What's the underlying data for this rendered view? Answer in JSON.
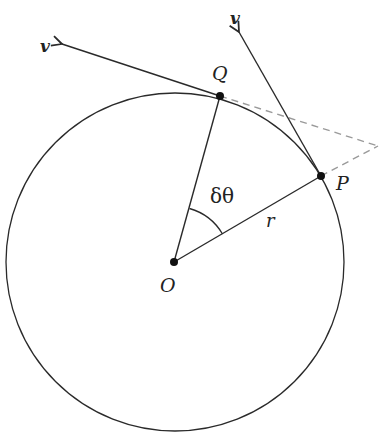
{
  "diagram": {
    "title": "",
    "labels": {
      "center": "O",
      "point_p": "P",
      "point_q": "Q",
      "radius": "r",
      "angle": "δθ",
      "velocity_p": "v",
      "velocity_q": "v"
    },
    "colors": {
      "stroke": "#2a2a2a",
      "dashed": "#9a9a9a",
      "background": "#ffffff"
    },
    "geometry": {
      "center": [
        174,
        262
      ],
      "radius": 169,
      "P": [
        321,
        176
      ],
      "Q": [
        220,
        96
      ],
      "v_at_P_tip": [
        238,
        30
      ],
      "v_at_Q_tip": [
        60,
        44
      ],
      "tangent_intersection": [
        378,
        146
      ]
    }
  }
}
